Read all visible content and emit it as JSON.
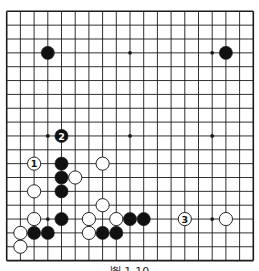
{
  "diagram": {
    "type": "go-board",
    "size": 19,
    "colors": {
      "background": "#ffffff",
      "line": "#1a1a1a",
      "black": "#111111",
      "white": "#ffffff",
      "stroke": "#222222",
      "faint": "#bbbbbb"
    },
    "geometry": {
      "x0": 6.7,
      "y0": 11.3,
      "dx": 13.7,
      "dy": 13.85,
      "stone_r": 6.6
    },
    "star_points": [
      [
        3,
        3
      ],
      [
        9,
        3
      ],
      [
        15,
        3
      ],
      [
        3,
        9
      ],
      [
        9,
        9
      ],
      [
        15,
        9
      ],
      [
        3,
        15
      ],
      [
        9,
        15
      ],
      [
        15,
        15
      ]
    ],
    "stones": [
      {
        "color": "black",
        "col": 3,
        "row": 3
      },
      {
        "color": "black",
        "col": 16,
        "row": 3
      },
      {
        "color": "black",
        "col": 4,
        "row": 9,
        "label": "2"
      },
      {
        "color": "white",
        "col": 2,
        "row": 11,
        "label": "1"
      },
      {
        "color": "black",
        "col": 4,
        "row": 11
      },
      {
        "color": "white",
        "col": 7,
        "row": 11
      },
      {
        "color": "black",
        "col": 4,
        "row": 12
      },
      {
        "color": "white",
        "col": 5,
        "row": 12
      },
      {
        "color": "white",
        "col": 2,
        "row": 13
      },
      {
        "color": "black",
        "col": 4,
        "row": 13
      },
      {
        "color": "white",
        "col": 7,
        "row": 14
      },
      {
        "color": "white",
        "col": 2,
        "row": 15
      },
      {
        "color": "black",
        "col": 4,
        "row": 15
      },
      {
        "color": "white",
        "col": 6,
        "row": 15
      },
      {
        "color": "white",
        "col": 8,
        "row": 15
      },
      {
        "color": "black",
        "col": 9,
        "row": 15
      },
      {
        "color": "black",
        "col": 10,
        "row": 15
      },
      {
        "color": "white",
        "col": 13,
        "row": 15,
        "label": "3"
      },
      {
        "color": "white",
        "col": 16,
        "row": 15
      },
      {
        "color": "white",
        "col": 1,
        "row": 16
      },
      {
        "color": "black",
        "col": 2,
        "row": 16
      },
      {
        "color": "black",
        "col": 3,
        "row": 16
      },
      {
        "color": "white",
        "col": 6,
        "row": 16
      },
      {
        "color": "black",
        "col": 7,
        "row": 16
      },
      {
        "color": "black",
        "col": 8,
        "row": 16
      },
      {
        "color": "white",
        "col": 1,
        "row": 17
      }
    ],
    "caption": "图 1-10"
  }
}
